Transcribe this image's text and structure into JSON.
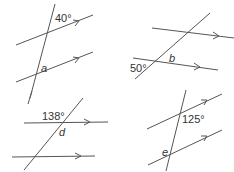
{
  "figures": [
    {
      "id": "fig-a",
      "given_angle": "40°",
      "unknown": "a"
    },
    {
      "id": "fig-b",
      "given_angle": "50°",
      "unknown": "b"
    },
    {
      "id": "fig-d",
      "given_angle": "138°",
      "unknown": "d"
    },
    {
      "id": "fig-e",
      "given_angle": "125°",
      "unknown": "e"
    }
  ],
  "colors": {
    "line": "#555555",
    "text": "#333333",
    "background": "#ffffff"
  }
}
